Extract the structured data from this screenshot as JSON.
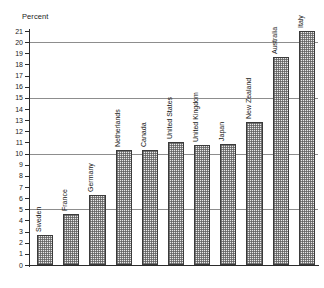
{
  "chart_data": {
    "type": "bar",
    "title": "",
    "subtitle": "",
    "xlabel": "",
    "ylabel": "Percent",
    "ylim": [
      0,
      21
    ],
    "yticks": [
      0,
      1,
      2,
      3,
      4,
      5,
      6,
      7,
      8,
      9,
      10,
      11,
      12,
      13,
      14,
      15,
      16,
      17,
      18,
      19,
      20,
      21
    ],
    "ytick_labels": [
      "0",
      "1",
      "2",
      "3",
      "4",
      "5",
      "6",
      "7",
      "8",
      "9",
      "10",
      "11",
      "12",
      "13",
      "14",
      "15",
      "16",
      "17",
      "18",
      "19",
      "20",
      "21"
    ],
    "gridlines": [
      5,
      10,
      15,
      20
    ],
    "grid": true,
    "legend": "none",
    "categories": [
      "Sweden",
      "France",
      "Germany",
      "Netherlands",
      "Canada",
      "United States",
      "United Kingdom",
      "Japan",
      "New Zealand",
      "Australia",
      "Italy"
    ],
    "values": [
      2.7,
      4.6,
      6.3,
      10.3,
      10.3,
      11.0,
      10.8,
      10.9,
      12.8,
      18.7,
      21.0
    ],
    "annotations": []
  },
  "axis": {
    "ylabel": "Percent"
  }
}
